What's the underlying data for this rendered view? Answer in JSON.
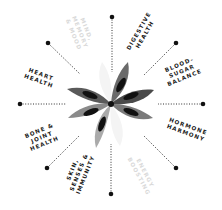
{
  "diagram": {
    "center": {
      "x": 111,
      "y": 104
    },
    "colors": {
      "ink": "#1a1a1a",
      "faded": "#d9d9d9",
      "petal_dark": "#4a4a4a",
      "petal_mid": "#7a7a7a",
      "petal_light": "#aaaaaa",
      "petal_core": "#111111"
    },
    "spokes": [
      {
        "id": "top",
        "dot": [
          112,
          17
        ]
      },
      {
        "id": "top-right",
        "dot": [
          176,
          43
        ]
      },
      {
        "id": "right",
        "dot": [
          203,
          104
        ]
      },
      {
        "id": "bottom-right",
        "dot": [
          176,
          168
        ]
      },
      {
        "id": "bottom",
        "dot": [
          111,
          194
        ]
      },
      {
        "id": "bottom-left",
        "dot": [
          47,
          168
        ]
      },
      {
        "id": "left",
        "dot": [
          20,
          104
        ]
      },
      {
        "id": "top-left",
        "dot": [
          48,
          43
        ]
      }
    ],
    "labels": [
      {
        "id": "mind",
        "text": "MIND,\nMEMORY\n& MOOD",
        "faded": true
      },
      {
        "id": "digestive",
        "text": "DIGESTIVE\nHEALTH",
        "faded": false
      },
      {
        "id": "blood-sugar",
        "text": "BLOOD-\nSUGAR\nBALANCE",
        "faded": false
      },
      {
        "id": "hormone",
        "text": "HORMONE\nHARMONY",
        "faded": false
      },
      {
        "id": "energy",
        "text": "ENERGY\nBOOSTING",
        "faded": true
      },
      {
        "id": "skin",
        "text": "SKIN,\nSENSES &\nIMMUNITY",
        "faded": false
      },
      {
        "id": "bone",
        "text": "BONE &\nJOINT\nHEALTH",
        "faded": false
      },
      {
        "id": "heart",
        "text": "HEART\nHEALTH",
        "faded": false
      }
    ]
  }
}
